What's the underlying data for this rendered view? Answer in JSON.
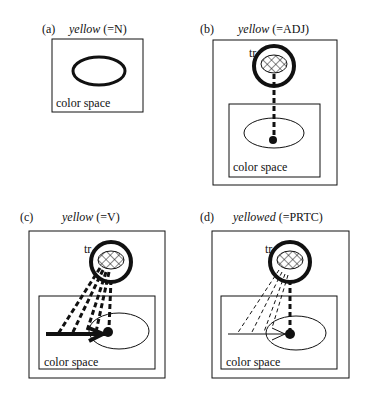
{
  "panels": [
    {
      "id": "a",
      "label": "(a)",
      "word": "yellow",
      "category": "(=N)",
      "space_label": "color space"
    },
    {
      "id": "b",
      "label": "(b)",
      "word": "yellow",
      "category": "(=ADJ)",
      "space_label": "color space",
      "trajector_label": "tr"
    },
    {
      "id": "c",
      "label": "(c)",
      "word": "yellow",
      "category": "(=V)",
      "space_label": "color space",
      "trajector_label": "tr"
    },
    {
      "id": "d",
      "label": "(d)",
      "word": "yellowed",
      "category": "(=PRTC)",
      "space_label": "color space",
      "trajector_label": "tr"
    }
  ]
}
